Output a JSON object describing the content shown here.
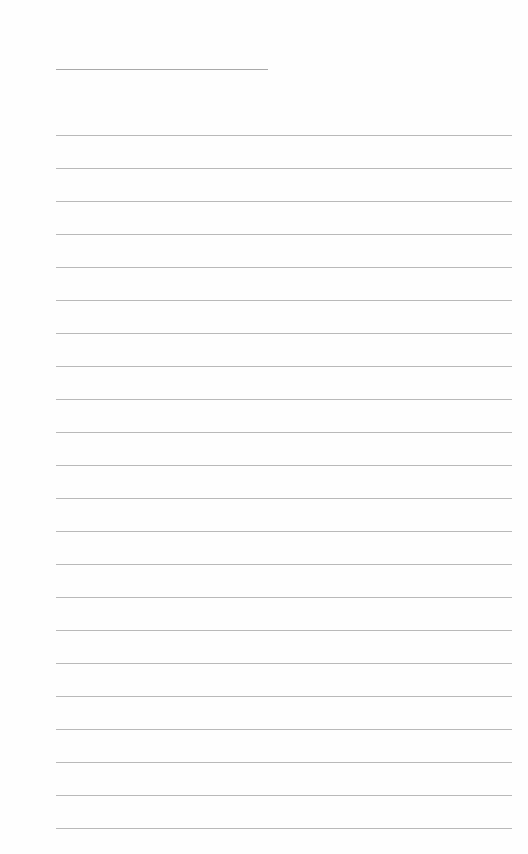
{
  "page": {
    "type": "lined-paper",
    "background_color": "#fefefe",
    "line_color": "#b9b9b9",
    "title_line": {
      "text": "",
      "x": 56,
      "y": 69,
      "width": 212
    },
    "ruled_lines": {
      "count": 22,
      "first_y": 135,
      "spacing": 33,
      "x": 56,
      "width": 456
    }
  }
}
